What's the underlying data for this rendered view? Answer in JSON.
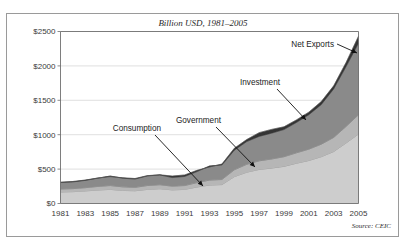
{
  "figure": {
    "ghost_header": "",
    "source_note": "Source: CEIC"
  },
  "chart_data": {
    "type": "area",
    "title": "Billion USD, 1981–2005",
    "xlabel": "",
    "ylabel": "",
    "stacked": true,
    "grid": true,
    "legend_position": "inline-annotations",
    "ylim": [
      0,
      2500
    ],
    "xlim": [
      1981,
      2005
    ],
    "ytick_labels": [
      "$0",
      "$500",
      "$1000",
      "$1500",
      "$2000",
      "$2500"
    ],
    "ytick_values": [
      0,
      500,
      1000,
      1500,
      2000,
      2500
    ],
    "xtick_labels": [
      "1981",
      "1983",
      "1985",
      "1987",
      "1989",
      "1991",
      "1993",
      "1995",
      "1997",
      "1999",
      "2001",
      "2003",
      "2005"
    ],
    "xtick_values": [
      1981,
      1983,
      1985,
      1987,
      1989,
      1991,
      1993,
      1995,
      1997,
      1999,
      2001,
      2003,
      2005
    ],
    "x": [
      1981,
      1982,
      1983,
      1984,
      1985,
      1986,
      1987,
      1988,
      1989,
      1990,
      1991,
      1992,
      1993,
      1994,
      1995,
      1996,
      1997,
      1998,
      1999,
      2000,
      2001,
      2002,
      2003,
      2004,
      2005
    ],
    "series": [
      {
        "name": "Consumption",
        "color": "#cdcdcd",
        "values": [
          168,
          172,
          183,
          196,
          205,
          190,
          185,
          205,
          215,
          198,
          205,
          240,
          268,
          275,
          390,
          455,
          495,
          515,
          540,
          585,
          625,
          680,
          755,
          880,
          1010
        ]
      },
      {
        "name": "Government",
        "color": "#b6b6b6",
        "values": [
          42,
          44,
          47,
          52,
          56,
          52,
          50,
          56,
          58,
          54,
          56,
          64,
          72,
          74,
          100,
          115,
          125,
          132,
          140,
          152,
          165,
          182,
          205,
          240,
          280
        ]
      },
      {
        "name": "Investment",
        "color": "#8a8a8a",
        "values": [
          95,
          98,
          106,
          120,
          138,
          126,
          120,
          140,
          142,
          125,
          132,
          160,
          205,
          210,
          285,
          330,
          355,
          375,
          395,
          440,
          500,
          575,
          705,
          870,
          1040
        ]
      },
      {
        "name": "Net Exports",
        "color": "#343434",
        "values": [
          5,
          6,
          5,
          2,
          -8,
          6,
          8,
          4,
          2,
          22,
          22,
          18,
          -14,
          14,
          28,
          30,
          55,
          55,
          40,
          38,
          38,
          44,
          45,
          60,
          102
        ]
      }
    ],
    "annotations": [
      {
        "label": "Consumption",
        "target_series": "Consumption"
      },
      {
        "label": "Government",
        "target_series": "Government"
      },
      {
        "label": "Investment",
        "target_series": "Investment"
      },
      {
        "label": "Net Exports",
        "target_series": "Net Exports"
      }
    ]
  }
}
